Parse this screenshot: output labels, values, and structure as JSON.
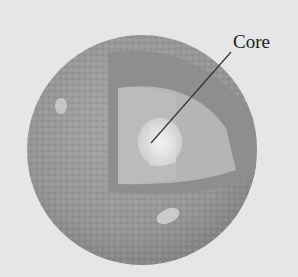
{
  "diagram": {
    "labels": [
      {
        "text": "Core",
        "points_to": "core"
      }
    ],
    "layers": [
      "crust",
      "mantle",
      "outer-core",
      "core"
    ],
    "colors": {
      "background": "#e6e6e6",
      "surface": "#9a9a9a",
      "mantle": "#8c8c8c",
      "outer_core": "#b4b4b4",
      "core": "#e2e2e2",
      "leader_line": "#333333",
      "label_text": "#222222"
    }
  }
}
